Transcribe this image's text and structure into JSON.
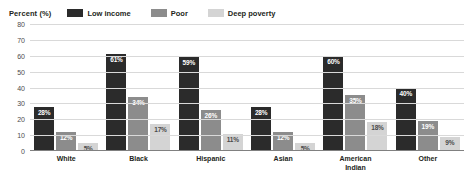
{
  "chart_data": {
    "type": "bar",
    "title": "",
    "xlabel": "",
    "ylabel": "Percent (%)",
    "ylim": [
      0,
      80
    ],
    "yticks": [
      0,
      10,
      20,
      30,
      40,
      50,
      60,
      70,
      80
    ],
    "grid": true,
    "legend_position": "top",
    "categories": [
      "White",
      "Black",
      "Hispanic",
      "Asian",
      "American Indian",
      "Other"
    ],
    "series": [
      {
        "name": "Low income",
        "color": "#2b2b2b",
        "values": [
          28,
          61,
          59,
          28,
          60,
          40
        ]
      },
      {
        "name": "Poor",
        "color": "#8c8c8c",
        "values": [
          12,
          34,
          26,
          12,
          35,
          19
        ]
      },
      {
        "name": "Deep poverty",
        "color": "#d4d4d4",
        "values": [
          5,
          17,
          11,
          5,
          18,
          9
        ]
      }
    ],
    "value_labels": [
      [
        "28%",
        "61%",
        "59%",
        "28%",
        "60%",
        "40%"
      ],
      [
        "12%",
        "34%",
        "26%",
        "12%",
        "35%",
        "19%"
      ],
      [
        "5%",
        "17%",
        "11%",
        "5%",
        "18%",
        "9%"
      ]
    ]
  },
  "axis": {
    "y_title": "Percent (%)",
    "tick_labels": [
      "80",
      "70",
      "60",
      "50",
      "40",
      "30",
      "20",
      "10",
      "0"
    ]
  },
  "legend": {
    "items": [
      {
        "label": "Low income",
        "color": "#2b2b2b"
      },
      {
        "label": "Poor",
        "color": "#8c8c8c"
      },
      {
        "label": "Deep poverty",
        "color": "#d4d4d4"
      }
    ]
  },
  "category_lines": [
    [
      "White"
    ],
    [
      "Black"
    ],
    [
      "Hispanic"
    ],
    [
      "Asian"
    ],
    [
      "American",
      "Indian"
    ],
    [
      "Other"
    ]
  ]
}
